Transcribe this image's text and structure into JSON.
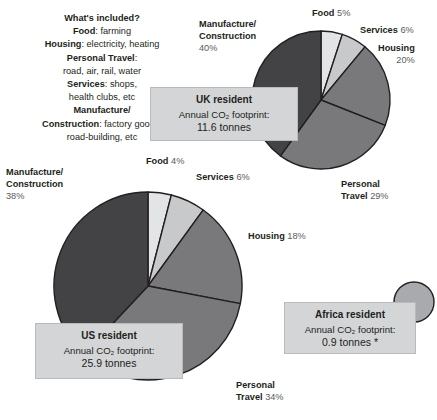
{
  "key": {
    "heading": "What's included?",
    "lines": [
      {
        "term": "Food",
        "desc": ": farming"
      },
      {
        "term": "Housing",
        "desc": ": electricity, heating"
      },
      {
        "term": "Personal Travel",
        "desc": ":"
      },
      {
        "term": "",
        "desc": "road, air, rail, water"
      },
      {
        "term": "Services",
        "desc": ": shops,"
      },
      {
        "term": "",
        "desc": "health clubs, etc"
      },
      {
        "term": "Manufacture/",
        "desc": ""
      },
      {
        "term": "Construction",
        "desc": ": factory goods,"
      },
      {
        "term": "",
        "desc": "road-building, etc"
      }
    ]
  },
  "callouts": {
    "uk": {
      "title": "UK resident",
      "line2": "Annual CO₂ footprint:",
      "line3": "11.6 tonnes"
    },
    "us": {
      "title": "US resident",
      "line2": "Annual CO₂ footprint:",
      "line3": "25.9 tonnes"
    },
    "africa": {
      "title": "Africa resident",
      "line2": "Annual CO₂ footprint:",
      "line3": "0.9 tonnes *"
    }
  },
  "labels": {
    "uk": {
      "manufacture_name": "Manufacture/",
      "manufacture_name2": "Construction",
      "manufacture_pct": "40%",
      "food_name": "Food",
      "food_pct": "5%",
      "services_name": "Services",
      "services_pct": "6%",
      "housing_name": "Housing",
      "housing_pct": "20%",
      "travel_name": "Personal",
      "travel_name2": "Travel",
      "travel_pct": "29%"
    },
    "us": {
      "manufacture_name": "Manufacture/",
      "manufacture_name2": "Construction",
      "manufacture_pct": "38%",
      "food_name": "Food",
      "food_pct": "4%",
      "services_name": "Services",
      "services_pct": "6%",
      "housing_name": "Housing",
      "housing_pct": "18%",
      "travel_name": "Personal",
      "travel_name2": "Travel",
      "travel_pct": "34%"
    }
  },
  "footnote": "",
  "colors": {
    "slice_dark": "#434345",
    "slice_medium": "#79797c",
    "slice_light": "#c8c9cb",
    "slice_lighter": "#e3e4e5",
    "africa_circle": "#a9aaad",
    "callout_bg": "#d4d5d7",
    "stroke": "#231f20",
    "text": "#231f20",
    "text_muted": "#5a5a5c"
  },
  "chart_data": [
    {
      "type": "pie",
      "title": "UK resident",
      "subtitle": "Annual CO₂ footprint: 11.6 tonnes",
      "total_tonnes": 11.6,
      "units": "tonnes CO₂ per year",
      "categories": [
        "Food",
        "Services",
        "Housing",
        "Personal Travel",
        "Manufacture/Construction"
      ],
      "values": [
        5,
        6,
        20,
        29,
        40
      ],
      "value_unit": "percent",
      "legend": "labels on slices",
      "start_angle_deg": 0,
      "direction": "clockwise",
      "slice_colors": [
        "#e3e4e5",
        "#c8c9cb",
        "#79797c",
        "#79797c",
        "#434345"
      ]
    },
    {
      "type": "pie",
      "title": "US resident",
      "subtitle": "Annual CO₂ footprint: 25.9 tonnes",
      "total_tonnes": 25.9,
      "units": "tonnes CO₂ per year",
      "categories": [
        "Food",
        "Services",
        "Housing",
        "Personal Travel",
        "Manufacture/Construction"
      ],
      "values": [
        4,
        6,
        18,
        34,
        38
      ],
      "value_unit": "percent",
      "legend": "labels on slices",
      "start_angle_deg": 0,
      "direction": "clockwise",
      "slice_colors": [
        "#e3e4e5",
        "#c8c9cb",
        "#79797c",
        "#79797c",
        "#434345"
      ]
    },
    {
      "type": "pie",
      "title": "Africa resident",
      "subtitle": "Annual CO₂ footprint: 0.9 tonnes *",
      "total_tonnes": 0.9,
      "units": "tonnes CO₂ per year",
      "categories": [
        "Total"
      ],
      "values": [
        100
      ],
      "value_unit": "percent",
      "note": "shown as a single small circle sized by total footprint",
      "slice_colors": [
        "#a9aaad"
      ]
    }
  ]
}
